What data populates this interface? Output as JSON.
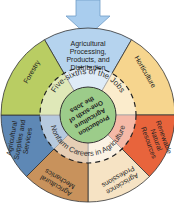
{
  "diagram": {
    "arrow_color": "#a9cdee",
    "outer_segments": [
      {
        "label_lines": [
          "Agricultural",
          "Processing,",
          "Products, and",
          "Distribution"
        ],
        "color": "#b5d3ee"
      },
      {
        "label_lines": [
          "Horticulture"
        ],
        "color": "#f6d58e"
      },
      {
        "label_lines": [
          "Renewable",
          "Natural",
          "Resources"
        ],
        "color": "#e8643c"
      },
      {
        "label_lines": [
          "Agriscience",
          "Professions"
        ],
        "color": "#f6e3c4"
      },
      {
        "label_lines": [
          "Agricultural",
          "Mechanics"
        ],
        "color": "#c8925c"
      },
      {
        "label_lines": [
          "Agricultural",
          "Supplies and",
          "Services"
        ],
        "color": "#5e88b5"
      },
      {
        "label_lines": [
          "Forestry"
        ],
        "color": "#b9cd63"
      }
    ],
    "inner_ring": {
      "top_label": "Five-sixths of the Jobs",
      "bottom_label": "Nonfarm Careers in Agriculture"
    },
    "center": {
      "label_lines": [
        "Production",
        "Agriculture",
        "One-sixth of",
        "the Jobs"
      ],
      "color": "#9ccc8a"
    }
  }
}
